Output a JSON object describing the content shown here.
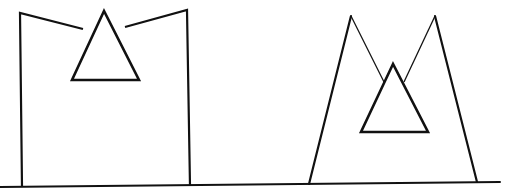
{
  "diagram": {
    "stroke_color": "#111111",
    "background_color": "#ffffff",
    "ground_line": {
      "x1": 0,
      "y1": 187,
      "x2": 500,
      "y2": 182,
      "width": 2
    },
    "figures": [
      {
        "name": "left-figure",
        "outline": "22,187 20,13 83,29 M125,27 187,10 190,186",
        "outline_width": 2.2,
        "triangle": "104,11 72,80 139,80",
        "triangle_width": 2.6
      },
      {
        "name": "right-figure",
        "outline": "309,184 351,16 477,182",
        "right_outline": "435,16 477,182",
        "thin_lines": [
          {
            "x1": 351,
            "y1": 16,
            "x2": 384,
            "y2": 82
          },
          {
            "x1": 435,
            "y1": 16,
            "x2": 404,
            "y2": 82
          }
        ],
        "outline_width": 2.2,
        "triangle": "393,64 361,132 428,132",
        "triangle_width": 2.6
      }
    ]
  }
}
